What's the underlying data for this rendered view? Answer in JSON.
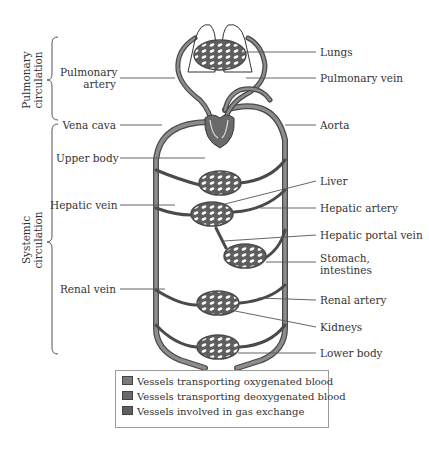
{
  "colors": {
    "oxygenated": "#7a7a7a",
    "deoxygenated": "#6a6a6a",
    "gas_exchange": "#5e5e5e",
    "vessel_outline": "#4a4a4a",
    "vessel_fill": "#8c8c8c",
    "label_line": "#555555"
  },
  "brackets": {
    "pulmonary": {
      "line1": "Pulmonary",
      "line2": "circulation"
    },
    "systemic": {
      "line1": "Systemic",
      "line2": "circulation"
    }
  },
  "labels_left": {
    "pulmonary_artery_1": "Pulmonary",
    "pulmonary_artery_2": "artery",
    "vena_cava": "Vena cava",
    "upper_body": "Upper body",
    "hepatic_vein": "Hepatic vein",
    "renal_vein": "Renal vein"
  },
  "labels_right": {
    "lungs": "Lungs",
    "pulmonary_vein": "Pulmonary vein",
    "aorta": "Aorta",
    "liver": "Liver",
    "hepatic_artery": "Hepatic artery",
    "hepatic_portal_vein": "Hepatic portal vein",
    "stomach_1": "Stomach,",
    "stomach_2": "intestines",
    "renal_artery": "Renal artery",
    "kidneys": "Kidneys",
    "lower_body": "Lower body"
  },
  "legend": {
    "items": [
      {
        "label": "Vessels transporting oxygenated blood"
      },
      {
        "label": "Vessels transporting deoxygenated blood"
      },
      {
        "label": "Vessels involved in gas exchange"
      }
    ]
  }
}
